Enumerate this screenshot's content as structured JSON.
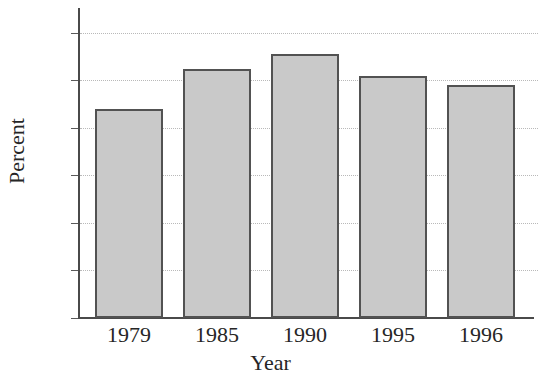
{
  "chart_data": {
    "type": "bar",
    "title": "",
    "subtitle": "",
    "xlabel": "Year",
    "ylabel": "Percent",
    "categories": [
      "1979",
      "1985",
      "1990",
      "1995",
      "1996"
    ],
    "values": [
      44,
      52.5,
      55.5,
      51,
      49
    ],
    "ylim": [
      0,
      60
    ],
    "ytick_labels": [
      "60",
      "50",
      "40",
      "30",
      "20",
      "10",
      "0"
    ],
    "ytick_values": [
      60,
      50,
      40,
      30,
      20,
      10,
      0
    ],
    "grid": true,
    "grid_axis": "y",
    "grid_style": "dotted",
    "legend": false,
    "legend_position": "none",
    "series": [
      {
        "name": "Percent",
        "values": [
          44,
          52.5,
          55.5,
          51,
          49
        ]
      }
    ],
    "colors": {
      "bar_fill": "#c9c9c9",
      "bar_border": "#525252",
      "axis": "#4a4a4a",
      "grid": "#b9b9b9",
      "text": "#262626",
      "background": "#ffffff"
    }
  }
}
